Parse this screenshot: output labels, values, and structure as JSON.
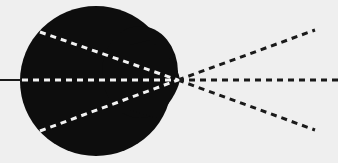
{
  "diagram": {
    "background_color": "#efefef",
    "body_color": "#0d0d0d",
    "inner_ray_color": "#f2f2f2",
    "outer_ray_color": "#1a1a1a",
    "focal_point": {
      "x": 178,
      "y": 80
    },
    "incoming_line": {
      "x1": 0,
      "y1": 80,
      "x2": 22,
      "y2": 80
    },
    "inner_rays": [
      {
        "x1": 40,
        "y1": 32,
        "x2": 178,
        "y2": 80
      },
      {
        "x1": 22,
        "y1": 80,
        "x2": 178,
        "y2": 80
      },
      {
        "x1": 40,
        "y1": 131,
        "x2": 178,
        "y2": 80
      }
    ],
    "outer_rays": [
      {
        "x1": 178,
        "y1": 80,
        "x2": 315,
        "y2": 30
      },
      {
        "x1": 178,
        "y1": 80,
        "x2": 338,
        "y2": 80
      },
      {
        "x1": 178,
        "y1": 80,
        "x2": 315,
        "y2": 130
      }
    ]
  }
}
